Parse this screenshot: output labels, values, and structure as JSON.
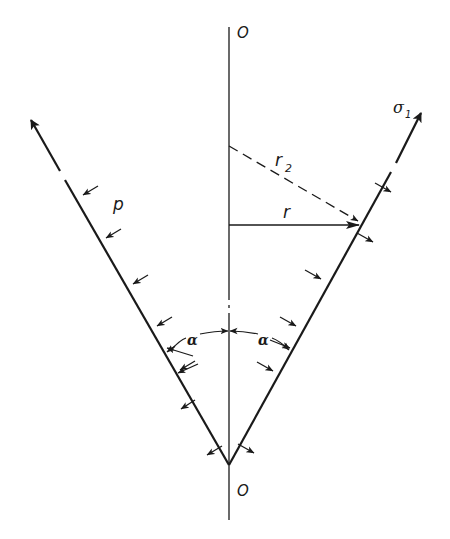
{
  "diagram": {
    "labels": {
      "top_origin": "O",
      "bottom_origin": "O",
      "meridional_stress": "σ",
      "meridional_stress_sub": "1",
      "radius_2": "r",
      "radius_2_sub": "2",
      "radius": "r",
      "pressure": "p",
      "half_angle_left": "α",
      "half_angle_right": "α"
    },
    "colors": {
      "line": "#1a1a1a",
      "background": "#ffffff"
    }
  }
}
